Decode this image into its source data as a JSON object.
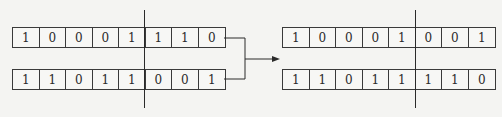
{
  "diagram": {
    "parents": {
      "row1": [
        "1",
        "0",
        "0",
        "0",
        "1",
        "1",
        "1",
        "0"
      ],
      "row2": [
        "1",
        "1",
        "0",
        "1",
        "1",
        "0",
        "0",
        "1"
      ]
    },
    "offspring": {
      "row1": [
        "1",
        "0",
        "0",
        "0",
        "1",
        "0",
        "0",
        "1"
      ],
      "row2": [
        "1",
        "1",
        "0",
        "1",
        "1",
        "1",
        "1",
        "0"
      ]
    },
    "crossover_point_after_index": 4,
    "colors": {
      "line": "#2a2a2a",
      "background": "#f4f4f2"
    }
  }
}
